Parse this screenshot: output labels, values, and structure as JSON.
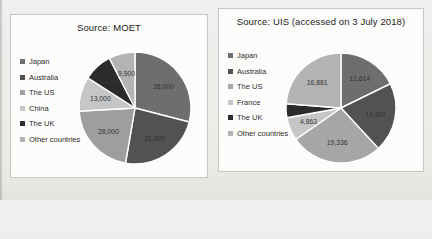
{
  "page": {
    "background_color": "#edecea",
    "panel_color": "#fcfcfb",
    "separator_color": "#ffffff"
  },
  "chart_data": [
    {
      "type": "pie",
      "title": "Source: MOET",
      "legend_position": "left",
      "categories": [
        "Japan",
        "Australia",
        "The US",
        "China",
        "The UK",
        "Other countries"
      ],
      "values": [
        38000,
        31000,
        28000,
        13000,
        11000,
        9900
      ],
      "value_labels": [
        "38,000",
        "31,000",
        "28,000",
        "13,000",
        "11,000",
        "9,900"
      ],
      "colors": [
        "#6e6e6e",
        "#525252",
        "#9e9e9e",
        "#c6c6c6",
        "#2b2b2b",
        "#b3b3b3"
      ]
    },
    {
      "type": "pie",
      "title": "Source: UIS (accessed on 3 July 2018)",
      "legend_position": "left",
      "categories": [
        "Japan",
        "Australia",
        "The US",
        "France",
        "The UK",
        "Other countries"
      ],
      "values": [
        12614,
        14491,
        19336,
        4863,
        2901,
        16881
      ],
      "value_labels": [
        "12,614",
        "14,491",
        "19,336",
        "4,863",
        "2,901",
        "16,881"
      ],
      "colors": [
        "#6e6e6e",
        "#525252",
        "#a6a6a6",
        "#c6c6c6",
        "#2b2b2b",
        "#b3b3b3"
      ]
    }
  ]
}
